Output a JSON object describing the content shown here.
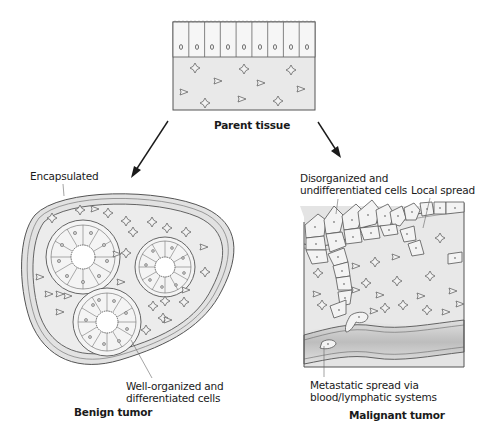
{
  "diagram": {
    "parent": {
      "title": "Parent tissue"
    },
    "benign": {
      "title": "Benign tumor",
      "labels": {
        "capsule": "Encapsulated",
        "cells_line1": "Well-organized and",
        "cells_line2": "differentiated cells"
      }
    },
    "malignant": {
      "title": "Malignant tumor",
      "labels": {
        "disorg_line1": "Disorganized and",
        "disorg_line2": "undifferentiated cells",
        "local": "Local spread",
        "meta_line1": "Metastatic spread via",
        "meta_line2": "blood/lymphatic systems"
      }
    },
    "colors": {
      "stroke": "#555555",
      "tissue_fill": "#e9e9e9",
      "cell_fill": "#f4f4f4",
      "vessel_fill": "#cfcfcf",
      "text": "#1a1a1a"
    }
  }
}
